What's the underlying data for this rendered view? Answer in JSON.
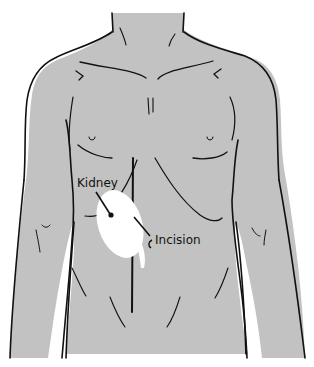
{
  "diagram": {
    "labels": {
      "kidney": "Kidney",
      "incision": "Incision"
    },
    "colors": {
      "skin": "#c2c2c2",
      "outline": "#111111",
      "kidney": "#ffffff",
      "background": "#ffffff"
    }
  }
}
